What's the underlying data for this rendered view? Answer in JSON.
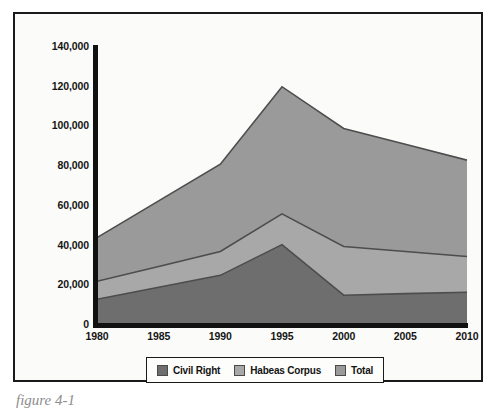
{
  "figure": {
    "caption": "figure 4-1",
    "background_color": "#fbfbf9",
    "frame_color": "#1a1a1a"
  },
  "legend": {
    "position": "bottom-center",
    "entries": [
      {
        "label": "Civil Right",
        "color": "#6e6e6e",
        "swatch_name": "legend-swatch-civil-right"
      },
      {
        "label": "Habeas Corpus",
        "color": "#a8a8a8",
        "swatch_name": "legend-swatch-habeas-corpus"
      },
      {
        "label": "Total",
        "color": "#9a9a9a",
        "swatch_name": "legend-swatch-total"
      }
    ]
  },
  "chart_data": {
    "type": "area",
    "title": "",
    "subtitle": "",
    "xlabel": "",
    "ylabel": "",
    "grid": false,
    "legend_position": "bottom-center",
    "x": [
      1980,
      1985,
      1990,
      1995,
      2000,
      2005,
      2010
    ],
    "categories": [
      "1980",
      "1985",
      "1990",
      "1995",
      "2000",
      "2005",
      "2010"
    ],
    "xlim": [
      1980,
      2010
    ],
    "ylim": [
      0,
      140000
    ],
    "y_ticks": [
      0,
      20000,
      40000,
      60000,
      80000,
      100000,
      120000,
      140000
    ],
    "y_tick_labels": [
      "0",
      "20,000",
      "40,000",
      "60,000",
      "80,000",
      "100,000",
      "120,000",
      "140,000"
    ],
    "x_ticks": [
      1980,
      1985,
      1990,
      1995,
      2000,
      2005,
      2010
    ],
    "x_tick_labels": [
      "1980",
      "1985",
      "1990",
      "1995",
      "2000",
      "2005",
      "2010"
    ],
    "vertex_years": [
      1980,
      1990,
      1995,
      2000,
      2010
    ],
    "series": [
      {
        "name": "Total",
        "color": "#9a9a9a",
        "values": [
          44000,
          62500,
          81000,
          120000,
          99000,
          91000,
          83000
        ],
        "vertex_values": [
          44000,
          81000,
          120000,
          99000,
          83000
        ]
      },
      {
        "name": "Habeas Corpus",
        "color": "#a8a8a8",
        "values": [
          22000,
          29500,
          37000,
          56000,
          39500,
          37000,
          34500
        ],
        "vertex_values": [
          22000,
          37000,
          56000,
          39500,
          34500
        ]
      },
      {
        "name": "Civil Right",
        "color": "#6e6e6e",
        "values": [
          13000,
          19000,
          25000,
          40500,
          15000,
          15800,
          16500
        ],
        "vertex_values": [
          13000,
          25000,
          40500,
          15000,
          16500
        ]
      }
    ]
  }
}
